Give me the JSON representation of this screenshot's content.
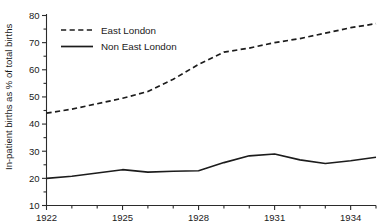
{
  "chart_data": {
    "type": "line",
    "title": "",
    "xlabel": "",
    "ylabel": "In-patient births as % of total births",
    "xlim": [
      1922,
      1935
    ],
    "ylim": [
      10,
      80
    ],
    "grid": false,
    "legend_position": "top-left",
    "x": [
      1922,
      1923,
      1924,
      1925,
      1926,
      1927,
      1928,
      1929,
      1930,
      1931,
      1932,
      1933,
      1934,
      1935
    ],
    "xtick_labels": [
      "1922",
      "1925",
      "1928",
      "1931",
      "1934"
    ],
    "xtick_values": [
      1922,
      1925,
      1928,
      1931,
      1934
    ],
    "xtick_minor_values": [
      1923,
      1924,
      1926,
      1927,
      1929,
      1930,
      1932,
      1933,
      1935
    ],
    "ytick_labels": [
      "10",
      "20",
      "30",
      "40",
      "50",
      "60",
      "70",
      "80"
    ],
    "ytick_values": [
      10,
      20,
      30,
      40,
      50,
      60,
      70,
      80
    ],
    "ytick_minor_values": [
      15,
      25,
      35,
      45,
      55,
      65,
      75
    ],
    "series": [
      {
        "name": "East London",
        "style": "dashed",
        "color": "#1c1c1c",
        "values": [
          44.0,
          45.5,
          47.5,
          49.5,
          52.0,
          56.5,
          62.0,
          66.5,
          68.0,
          70.0,
          71.5,
          73.5,
          75.5,
          77.0
        ]
      },
      {
        "name": "Non East London",
        "style": "solid",
        "color": "#1c1c1c",
        "values": [
          20.0,
          20.8,
          22.0,
          23.2,
          22.3,
          22.6,
          22.8,
          25.8,
          28.3,
          29.0,
          26.8,
          25.5,
          26.5,
          27.8
        ]
      }
    ]
  },
  "legend": {
    "entries": [
      {
        "label": "East London",
        "style": "dashed"
      },
      {
        "label": "Non East London",
        "style": "solid"
      }
    ]
  }
}
